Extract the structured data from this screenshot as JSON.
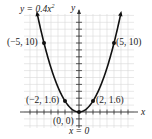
{
  "chart_data": {
    "type": "line",
    "title": "",
    "equation_label": "y = 0.4x²",
    "function": "y = 0.4x^2",
    "xlabel": "x",
    "ylabel": "y",
    "axis_of_symmetry_label": "x = 0",
    "xlim": [
      -8,
      8
    ],
    "ylim": [
      -2,
      14
    ],
    "grid": true,
    "x_tick_step": 1,
    "y_tick_step": 1,
    "points": [
      {
        "x": -5,
        "y": 10,
        "label": "(−5, 10)"
      },
      {
        "x": 5,
        "y": 10,
        "label": "(5, 10)"
      },
      {
        "x": -2,
        "y": 1.6,
        "label": "(−2, 1.6)"
      },
      {
        "x": 2,
        "y": 1.6,
        "label": "(2, 1.6)"
      },
      {
        "x": 0,
        "y": 0,
        "label": "(0, 0)"
      }
    ],
    "curve_x_range": [
      -5.9,
      5.9
    ],
    "colors": {
      "curve": "#111111",
      "grid": "#d9d9d9",
      "axis": "#333333"
    }
  },
  "labels": {
    "equation": "y = 0.4x",
    "equation_exp": "2",
    "y_axis": "y",
    "x_axis": "x",
    "symmetry": "x = 0",
    "p_neg5": "(−5, 10)",
    "p_5": "(5, 10)",
    "p_neg2": "(−2, 1.6)",
    "p_2": "(2, 1.6)",
    "p_0": "(0, 0)"
  }
}
